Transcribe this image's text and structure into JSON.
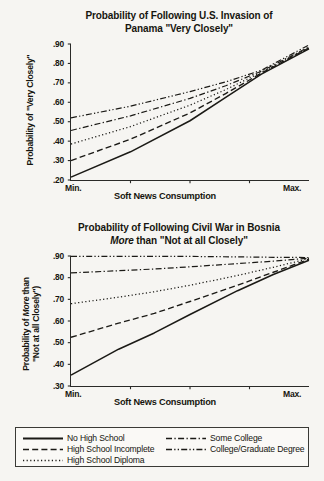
{
  "figure": {
    "background_color": "#f6f5f2",
    "ink_color": "#16150f"
  },
  "panels": [
    {
      "id": "panama",
      "title_line1": "Probability of Following U.S. Invasion of",
      "title_line2": "Panama \"Very Closely\"",
      "ytitle": "Probability of \"Very Closely\"",
      "xtitle": "Soft News Consumption",
      "xtick_min": "Min.",
      "xtick_max": "Max.",
      "yticks": [
        ".90",
        ".80",
        ".70",
        ".60",
        ".50",
        ".40",
        ".30",
        ".20"
      ]
    },
    {
      "id": "bosnia",
      "title_line1": "Probability of Following Civil War in Bosnia",
      "title_line2_pre": "",
      "title_line2_em": "More",
      "title_line2_post": " than \"Not at all Closely\"",
      "ytitle_line1_pre": "Probability of ",
      "ytitle_line1_em": "More",
      "ytitle_line1_post": " than",
      "ytitle_line2": "\"Not at all Closely\")",
      "xtitle": "Soft News Consumption",
      "xtick_min": "Min.",
      "xtick_max": "Max.",
      "yticks": [
        ".90",
        ".80",
        ".70",
        ".60",
        ".50",
        ".40",
        ".30"
      ]
    }
  ],
  "legend": {
    "entries": [
      {
        "label": "No High School",
        "style": "solid"
      },
      {
        "label": "High School Incomplete",
        "style": "dashed"
      },
      {
        "label": "High School Diploma",
        "style": "dotted"
      },
      {
        "label": "Some College",
        "style": "dash-dot"
      },
      {
        "label": "College/Graduate Degree",
        "style": "dash-dot-dot"
      }
    ]
  },
  "chart_data": [
    {
      "type": "line",
      "title": "Probability of Following U.S. Invasion of Panama \"Very Closely\"",
      "xlabel": "Soft News Consumption",
      "ylabel": "Probability of \"Very Closely\"",
      "xlim": [
        0,
        1
      ],
      "ylim": [
        0.2,
        0.9
      ],
      "xtick_labels": [
        "Min.",
        "Max."
      ],
      "ytick_values": [
        0.9,
        0.8,
        0.7,
        0.6,
        0.5,
        0.4,
        0.3,
        0.2
      ],
      "grid": false,
      "legend_position": "below-figure",
      "x": [
        0,
        0.25,
        0.5,
        0.65,
        0.8,
        1.0
      ],
      "series": [
        {
          "name": "No High School",
          "style": "solid",
          "values": [
            0.215,
            0.345,
            0.505,
            0.625,
            0.745,
            0.875
          ]
        },
        {
          "name": "High School Incomplete",
          "style": "dashed",
          "values": [
            0.3,
            0.41,
            0.545,
            0.645,
            0.75,
            0.88
          ]
        },
        {
          "name": "High School Diploma",
          "style": "dotted",
          "values": [
            0.385,
            0.475,
            0.585,
            0.665,
            0.755,
            0.88
          ]
        },
        {
          "name": "Some College",
          "style": "dash-dot",
          "values": [
            0.455,
            0.53,
            0.62,
            0.685,
            0.76,
            0.885
          ]
        },
        {
          "name": "College/Graduate Degree",
          "style": "dash-dot-dot",
          "values": [
            0.52,
            0.58,
            0.655,
            0.705,
            0.765,
            0.895
          ]
        }
      ]
    },
    {
      "type": "line",
      "title": "Probability of Following Civil War in Bosnia More than \"Not at all Closely\"",
      "xlabel": "Soft News Consumption",
      "ylabel": "Probability of More than \"Not at all Closely\")",
      "xlim": [
        0,
        1
      ],
      "ylim": [
        0.3,
        0.9
      ],
      "xtick_labels": [
        "Min.",
        "Max."
      ],
      "ytick_values": [
        0.9,
        0.8,
        0.7,
        0.6,
        0.5,
        0.4,
        0.3
      ],
      "grid": false,
      "legend_position": "below-figure",
      "x": [
        0,
        0.2,
        0.35,
        0.5,
        0.7,
        0.85,
        1.0
      ],
      "series": [
        {
          "name": "No High School",
          "style": "solid",
          "values": [
            0.35,
            0.47,
            0.545,
            0.63,
            0.74,
            0.815,
            0.88
          ]
        },
        {
          "name": "High School Incomplete",
          "style": "dashed",
          "values": [
            0.525,
            0.59,
            0.635,
            0.69,
            0.765,
            0.825,
            0.885
          ]
        },
        {
          "name": "High School Diploma",
          "style": "dotted",
          "values": [
            0.68,
            0.71,
            0.735,
            0.765,
            0.81,
            0.848,
            0.888
          ]
        },
        {
          "name": "Some College",
          "style": "dash-dot",
          "values": [
            0.822,
            0.832,
            0.84,
            0.85,
            0.865,
            0.876,
            0.89
          ]
        },
        {
          "name": "College/Graduate Degree",
          "style": "dash-dot-dot",
          "values": [
            0.898,
            0.898,
            0.898,
            0.898,
            0.896,
            0.894,
            0.893
          ]
        }
      ]
    }
  ]
}
